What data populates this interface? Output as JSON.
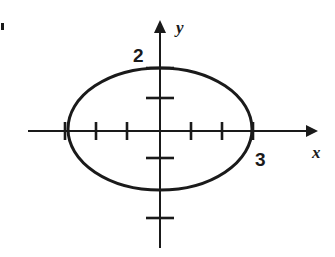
{
  "figure": {
    "background_color": "#ffffff",
    "ink_color": "#1a1a1a"
  },
  "axes": {
    "x_axis": {
      "name": "x-axis",
      "label": "x",
      "arrow": "right",
      "pixel_y": 131,
      "pixel_x_start": 28,
      "pixel_x_end": 312,
      "label_pixel_x": 312,
      "label_pixel_y": 158
    },
    "y_axis": {
      "name": "y-axis",
      "label": "y",
      "arrow": "up",
      "pixel_x": 160,
      "pixel_y_start": 25,
      "pixel_y_end": 248,
      "label_pixel_x": 176,
      "label_pixel_y": 33
    }
  },
  "ticks": {
    "x_ticks_pixels": [
      65,
      96,
      127,
      191,
      222,
      253
    ],
    "y_ticks_pixels": [
      68,
      98,
      158,
      218
    ],
    "tick_half_length_x": 9,
    "tick_half_length_y": 14
  },
  "labels": [
    {
      "name": "y-intercept-label",
      "text": "2",
      "pixel_x": 133,
      "pixel_y": 62
    },
    {
      "name": "x-intercept-label",
      "text": "3",
      "pixel_x": 255,
      "pixel_y": 166
    }
  ],
  "ellipse": {
    "name": "ellipse-curve",
    "center_pixel_x": 160,
    "center_pixel_y": 129,
    "radius_x_pixels": 92,
    "radius_y_pixels": 61,
    "stroke_width": 3,
    "fill": "none"
  },
  "artifact": {
    "name": "scan-artifact",
    "pixel_x": 1,
    "pixel_y": 23,
    "width": 3,
    "height": 7
  },
  "chart_data": {
    "type": "scatter",
    "xlabel": "x",
    "ylabel": "y",
    "x_intercepts": [
      -3,
      3
    ],
    "y_intercepts": [
      -2,
      2
    ],
    "semi_major_axis": 3,
    "semi_minor_axis": 2,
    "center": [
      0,
      0
    ],
    "xlim": [
      -4.25,
      4.9
    ],
    "ylim": [
      -3.9,
      3.45
    ],
    "x_tick_values": [
      -3,
      -2,
      -1,
      1,
      2,
      3
    ],
    "y_tick_values": [
      2,
      1,
      -1,
      -2
    ],
    "labeled_ticks": [
      {
        "axis": "y",
        "value": 2,
        "text": "2"
      },
      {
        "axis": "x",
        "value": 3,
        "text": "3"
      }
    ],
    "grid": false,
    "legend": null
  }
}
